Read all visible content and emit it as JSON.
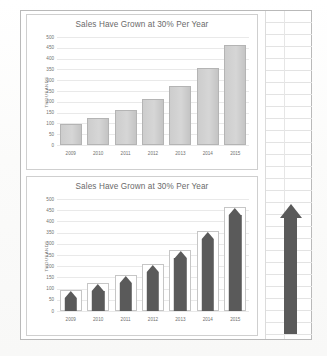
{
  "document": {
    "name": "slide-with-two-bar-charts"
  },
  "charts": [
    {
      "id": "top",
      "title": "Sales Have Grown at 30% Per Year",
      "ylabel": "THOUSANDS",
      "style": "plain-bars"
    },
    {
      "id": "bottom",
      "title": "Sales Have Grown at 30% Per Year",
      "ylabel": "THOUSANDS",
      "style": "arrow-bars"
    }
  ],
  "decoration": {
    "big_arrow_name": "up-arrow-shape"
  },
  "chart_data": [
    {
      "type": "bar",
      "title": "Sales Have Grown at 30% Per Year",
      "xlabel": "",
      "ylabel": "THOUSANDS",
      "categories": [
        "2009",
        "2010",
        "2011",
        "2012",
        "2013",
        "2014",
        "2015"
      ],
      "values": [
        96,
        125,
        162,
        211,
        274,
        357,
        464
      ],
      "ylim": [
        0,
        500
      ],
      "yticks": [
        0,
        50,
        100,
        150,
        200,
        250,
        300,
        350,
        400,
        450,
        500
      ],
      "grid": "horizontal",
      "legend": "none",
      "bar_color": "#cfcfcf",
      "bar_border_color": "#b4b4b4"
    },
    {
      "type": "bar",
      "title": "Sales Have Grown at 30% Per Year",
      "xlabel": "",
      "ylabel": "THOUSANDS",
      "categories": [
        "2009",
        "2010",
        "2011",
        "2012",
        "2013",
        "2014",
        "2015"
      ],
      "values": [
        96,
        125,
        162,
        211,
        274,
        357,
        464
      ],
      "ylim": [
        0,
        500
      ],
      "yticks": [
        0,
        50,
        100,
        150,
        200,
        250,
        300,
        350,
        400,
        450,
        500
      ],
      "grid": "horizontal",
      "legend": "none",
      "bar_color": "#ffffff",
      "bar_border_color": "#c6c6c6",
      "arrow_color": "#5a5a5a",
      "note": "each bar contains an upward dark arrow shape"
    }
  ]
}
